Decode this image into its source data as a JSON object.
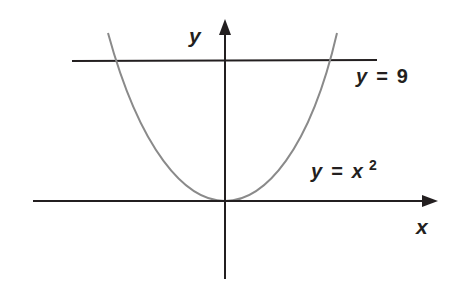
{
  "diagram": {
    "axes": {
      "x_label": "x",
      "y_label": "y"
    },
    "curves": [
      {
        "name": "parabola",
        "equation_lhs": "y",
        "equation_eq": "=",
        "equation_base": "x",
        "equation_exp": "2",
        "color": "#8a8a8a"
      },
      {
        "name": "horizontal-line",
        "equation_lhs": "y",
        "equation_eq": "=",
        "equation_rhs": "9",
        "color": "#231f20"
      }
    ],
    "colors": {
      "axis": "#231f20",
      "parabola": "#8a8a8a",
      "line": "#231f20",
      "background": "#ffffff"
    }
  }
}
